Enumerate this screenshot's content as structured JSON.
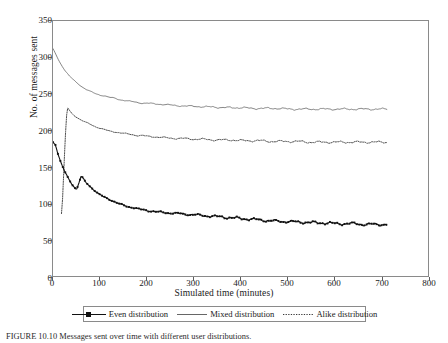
{
  "figure": {
    "caption": "FIGURE 10.10   Messages sent over time with different user distributions."
  },
  "axes": {
    "x_title": "Simulated time (minutes)",
    "y_title": "No. of messages sent",
    "x_ticks": [
      "0",
      "100",
      "200",
      "300",
      "400",
      "500",
      "600",
      "700",
      "800"
    ],
    "y_ticks": [
      "0",
      "50",
      "100",
      "150",
      "200",
      "250",
      "300",
      "350"
    ]
  },
  "legend": {
    "items": [
      {
        "label": "Even distribution",
        "style": "solid-marker",
        "marker": "square"
      },
      {
        "label": "Mixed distribution",
        "style": "solid",
        "marker": "none"
      },
      {
        "label": "Alike distribution",
        "style": "dotted",
        "marker": "none"
      }
    ]
  },
  "chart_data": {
    "type": "line",
    "title": "",
    "subtitle": "",
    "xlabel": "Simulated time (minutes)",
    "ylabel": "No. of messages sent",
    "xlim": [
      0,
      800
    ],
    "ylim": [
      0,
      350
    ],
    "xticks": [
      0,
      100,
      200,
      300,
      400,
      500,
      600,
      700,
      800
    ],
    "yticks": [
      0,
      50,
      100,
      150,
      200,
      250,
      300,
      350
    ],
    "grid": false,
    "legend_position": "below-axes",
    "x_data_extent": [
      0,
      710
    ],
    "series": [
      {
        "name": "Even distribution",
        "style": "solid",
        "marker": "square",
        "color": "#111111",
        "x": [
          0,
          5,
          10,
          15,
          20,
          25,
          30,
          35,
          40,
          45,
          50,
          60,
          70,
          80,
          90,
          100,
          110,
          120,
          130,
          140,
          150,
          160,
          170,
          180,
          190,
          200,
          220,
          240,
          260,
          280,
          300,
          320,
          340,
          360,
          380,
          400,
          420,
          440,
          460,
          480,
          500,
          520,
          540,
          560,
          580,
          600,
          620,
          640,
          660,
          680,
          700,
          710
        ],
        "y": [
          185,
          182,
          170,
          160,
          152,
          145,
          139,
          133,
          128,
          124,
          120,
          139,
          130,
          124,
          118,
          113,
          110,
          107,
          104,
          101,
          99,
          97,
          96,
          94,
          93,
          92,
          90,
          89,
          88,
          87,
          86,
          85,
          84,
          83,
          82,
          81,
          80,
          79,
          78,
          77,
          77,
          76,
          76,
          75,
          75,
          74,
          74,
          74,
          73,
          73,
          73,
          73
        ]
      },
      {
        "name": "Mixed distribution",
        "style": "solid",
        "marker": "none",
        "color": "#555555",
        "x": [
          0,
          5,
          10,
          15,
          20,
          25,
          30,
          35,
          40,
          45,
          50,
          60,
          70,
          80,
          90,
          100,
          110,
          120,
          130,
          140,
          150,
          160,
          170,
          180,
          190,
          200,
          220,
          240,
          260,
          280,
          300,
          320,
          340,
          360,
          380,
          400,
          420,
          440,
          460,
          480,
          500,
          520,
          540,
          560,
          580,
          600,
          620,
          640,
          660,
          680,
          700,
          710
        ],
        "y": [
          312,
          306,
          299,
          293,
          288,
          283,
          279,
          275,
          272,
          269,
          266,
          261,
          257,
          254,
          251,
          249,
          248,
          246,
          245,
          243,
          242,
          241,
          240,
          239,
          238,
          238,
          237,
          236,
          235,
          234,
          234,
          233,
          233,
          232,
          232,
          232,
          231,
          231,
          231,
          231,
          230,
          230,
          230,
          230,
          230,
          230,
          230,
          230,
          230,
          230,
          230,
          230
        ]
      },
      {
        "name": "Alike distribution",
        "style": "dotted",
        "marker": "none",
        "color": "#333333",
        "x": [
          18,
          20,
          22,
          24,
          26,
          28,
          30,
          32,
          35,
          40,
          45,
          50,
          60,
          70,
          80,
          90,
          100,
          110,
          120,
          130,
          140,
          150,
          160,
          170,
          180,
          190,
          200,
          220,
          240,
          260,
          280,
          300,
          320,
          340,
          360,
          380,
          400,
          420,
          440,
          460,
          480,
          500,
          520,
          540,
          560,
          580,
          600,
          620,
          640,
          660,
          680,
          700,
          710
        ],
        "y": [
          88,
          104,
          132,
          162,
          190,
          214,
          230,
          232,
          228,
          224,
          221,
          219,
          215,
          212,
          209,
          206,
          204,
          202,
          200,
          199,
          198,
          197,
          196,
          195,
          194,
          194,
          193,
          192,
          191,
          190,
          190,
          189,
          189,
          188,
          188,
          188,
          187,
          187,
          187,
          186,
          186,
          186,
          186,
          185,
          185,
          185,
          185,
          185,
          185,
          185,
          185,
          185,
          185
        ]
      }
    ],
    "annotations": [
      "Alike distribution rises from a low start to a peak near t=30 then decays",
      "All series show small periodic oscillations that grow toward later times",
      "Data series end near t=710 minutes"
    ]
  }
}
